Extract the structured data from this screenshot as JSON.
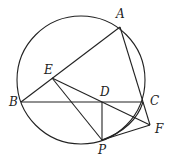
{
  "figure": {
    "type": "geometry",
    "circle": {
      "cx": 81,
      "cy": 80,
      "r": 64
    },
    "points": {
      "A": {
        "x": 120,
        "y": 27,
        "label": "A",
        "lx": 116,
        "ly": 18
      },
      "B": {
        "x": 21,
        "y": 102,
        "label": "B",
        "lx": 9,
        "ly": 106
      },
      "C": {
        "x": 143,
        "y": 102,
        "label": "C",
        "lx": 150,
        "ly": 105
      },
      "D": {
        "x": 102,
        "y": 102,
        "label": "D",
        "lx": 100,
        "ly": 96
      },
      "E": {
        "x": 52,
        "y": 78,
        "label": "E",
        "lx": 44,
        "ly": 74
      },
      "F": {
        "x": 150,
        "y": 125,
        "label": "F",
        "lx": 155,
        "ly": 133
      },
      "P": {
        "x": 102,
        "y": 140,
        "label": "P",
        "lx": 98,
        "ly": 154
      }
    },
    "segments": [
      [
        "A",
        "B"
      ],
      [
        "A",
        "C"
      ],
      [
        "B",
        "C"
      ],
      [
        "C",
        "F"
      ],
      [
        "E",
        "F"
      ],
      [
        "E",
        "P"
      ],
      [
        "D",
        "P"
      ],
      [
        "P",
        "F"
      ]
    ],
    "arcs": [
      {
        "from": "P",
        "to": "C",
        "note": "arc through D-P region to C"
      }
    ]
  }
}
